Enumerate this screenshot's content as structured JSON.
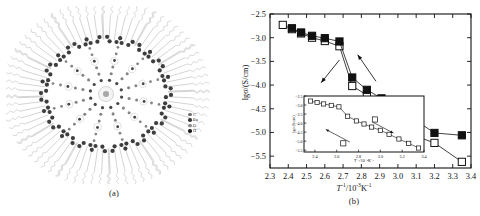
{
  "figure": {
    "panel_a": {
      "caption": "(a)",
      "description": "star-shaped dendrimer molecular structure",
      "legend": [
        {
          "label": "C",
          "color": "#6e6e6e"
        },
        {
          "label": "Eu",
          "color": "#3a3a3a"
        },
        {
          "label": "O",
          "color": "#8a8a8a"
        },
        {
          "label": "H",
          "color": "#1e1e1e"
        }
      ]
    },
    "panel_b": {
      "caption": "(b)",
      "ylabel": "lgσ/(S/cm)",
      "xlabel_main": "/10",
      "xlabel_T": "T",
      "xlabel_sup1": "-1",
      "xlabel_sup2": "-3",
      "xlabel_tail": "K",
      "xlabel_sup3": "-1"
    }
  },
  "chart_data": {
    "type": "line",
    "title": "",
    "xlabel": "T^-1 / 10^-3 K^-1",
    "ylabel": "lgσ/(S/cm)",
    "xlim": [
      2.3,
      3.4
    ],
    "ylim": [
      -5.75,
      -2.5
    ],
    "xticks": [
      2.3,
      2.4,
      2.5,
      2.6,
      2.7,
      2.8,
      2.9,
      3.0,
      3.1,
      3.2,
      3.3,
      3.4
    ],
    "yticks": [
      -2.5,
      -3.0,
      -3.5,
      -4.0,
      -4.5,
      -5.0,
      -5.5
    ],
    "grid": false,
    "legend": "none",
    "series": [
      {
        "name": "heating (filled squares)",
        "marker": "filled-square",
        "x": [
          2.42,
          2.47,
          2.53,
          2.6,
          2.68,
          2.75,
          2.83,
          2.91,
          3.0,
          3.1,
          3.2,
          3.35
        ],
        "y": [
          -2.8,
          -2.89,
          -2.96,
          -3.01,
          -3.08,
          -3.84,
          -4.1,
          -4.28,
          -4.51,
          -4.75,
          -5.01,
          -5.06
        ]
      },
      {
        "name": "cooling (open squares)",
        "marker": "open-square",
        "x": [
          2.37,
          2.42,
          2.47,
          2.53,
          2.6,
          2.68,
          2.75,
          2.83,
          2.91,
          3.0,
          3.1,
          3.2,
          3.35
        ],
        "y": [
          -2.73,
          -2.82,
          -2.91,
          -3.0,
          -3.07,
          -3.18,
          -4.02,
          -4.21,
          -4.5,
          -4.76,
          -5.08,
          -5.22,
          -5.62
        ]
      }
    ],
    "annotations": [
      {
        "type": "arrow",
        "label": "",
        "x_start": 2.68,
        "y_start": -3.47,
        "x_end": 2.58,
        "y_end": -3.95
      },
      {
        "type": "arrow",
        "label": "",
        "x_start": 2.88,
        "y_start": -3.92,
        "x_end": 2.78,
        "y_end": -3.36
      }
    ],
    "inset": {
      "type": "line",
      "xlim": [
        2.3,
        3.4
      ],
      "ylim": [
        -5.6,
        -2.5
      ],
      "xticks": [
        2.4,
        2.6,
        2.8,
        3.0,
        3.2,
        3.4
      ],
      "yticks": [
        -2.5,
        -3.0,
        -3.5,
        -4.0,
        -4.5,
        -5.0,
        -5.5
      ],
      "xlabel": "T^-1 / 10^-3 K^-1",
      "ylabel": "lgσ/(S/cm)",
      "series": [
        {
          "name": "inset open squares",
          "marker": "open-square",
          "x": [
            2.36,
            2.42,
            2.48,
            2.55,
            2.62,
            2.7,
            2.78,
            2.85,
            2.92,
            3.0,
            3.08,
            3.17,
            3.26,
            3.35
          ],
          "y": [
            -2.78,
            -2.86,
            -2.94,
            -3.02,
            -3.1,
            -3.62,
            -3.88,
            -4.05,
            -4.22,
            -4.4,
            -4.62,
            -4.88,
            -5.12,
            -5.38
          ]
        }
      ],
      "annotations": [
        {
          "type": "arrow",
          "x_start": 2.72,
          "y_start": -5.05,
          "x_end": 2.5,
          "y_end": -4.35
        },
        {
          "type": "arrow",
          "x_start": 2.93,
          "y_start": -3.95,
          "x_end": 3.12,
          "y_end": -4.55
        }
      ]
    }
  }
}
